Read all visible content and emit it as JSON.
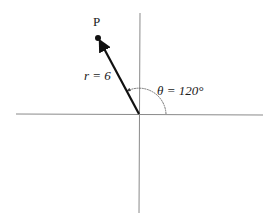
{
  "diagram": {
    "type": "polar-coordinate-diagram",
    "point_label": "P",
    "radius_label": "r = 6",
    "angle_label": "θ = 120°",
    "radius_value": 6,
    "angle_degrees": 120,
    "colors": {
      "axis": "#8a8a8a",
      "vector": "#111111",
      "arc": "#666666",
      "text": "#1a1a1a"
    }
  }
}
